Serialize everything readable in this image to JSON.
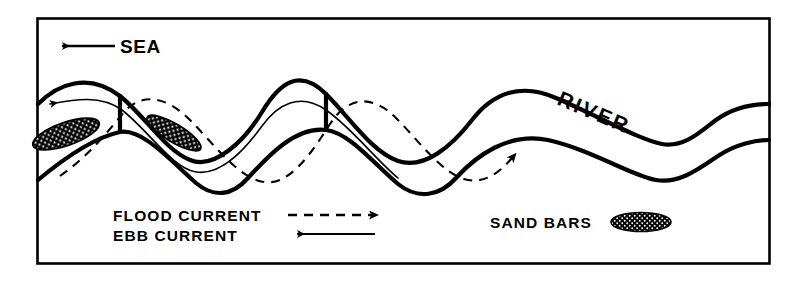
{
  "figure": {
    "name": "tidal-river-meander-diagram",
    "frame": {
      "x": 37,
      "y": 18,
      "width": 733,
      "height": 246,
      "stroke": "#000000",
      "stroke_width": 2.6
    },
    "background": "#ffffff",
    "ink": "#000000"
  },
  "labels": {
    "sea": "SEA",
    "river": "RIVER"
  },
  "legend": {
    "flood_current": "FLOOD CURRENT",
    "ebb_current": "EBB CURRENT",
    "sand_bars": "SAND BARS"
  },
  "diagram_data": {
    "type": "diagram",
    "subject": "Tidal river estuary with mutually evasive ebb and flood current channels",
    "features": [
      {
        "name": "river-channel-banks",
        "style": "thick solid outline",
        "description": "Sinuous meandering double bank forming three meander loops narrowing seaward"
      },
      {
        "name": "ebb-current-path",
        "style": "thin solid line with left arrowhead",
        "direction": "seaward (left)"
      },
      {
        "name": "flood-current-path",
        "style": "dashed line with right arrowhead",
        "direction": "landward (right)"
      },
      {
        "name": "sand-bars",
        "style": "stippled black ellipse",
        "count_in_channel": 2
      }
    ],
    "sea_direction": "left",
    "river_direction": "right"
  }
}
